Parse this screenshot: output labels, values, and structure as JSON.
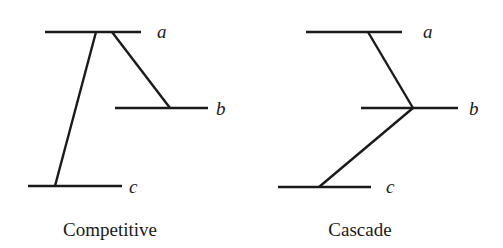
{
  "diagrams": [
    {
      "caption": "Competitive",
      "levels": [
        {
          "label": "a"
        },
        {
          "label": "b"
        },
        {
          "label": "c"
        }
      ],
      "transitions": [
        "a→c",
        "a→b"
      ]
    },
    {
      "caption": "Cascade",
      "levels": [
        {
          "label": "a"
        },
        {
          "label": "b"
        },
        {
          "label": "c"
        }
      ],
      "transitions": [
        "a→b",
        "b→c"
      ]
    }
  ],
  "colors": {
    "ink": "#1a1a1a",
    "background": "#ffffff"
  }
}
